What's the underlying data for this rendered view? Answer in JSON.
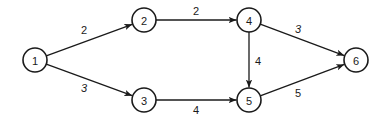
{
  "diagram": {
    "type": "directed-weighted-network",
    "nodes": [
      {
        "id": "1",
        "label": "1",
        "x": 35,
        "y": 60
      },
      {
        "id": "2",
        "label": "2",
        "x": 144,
        "y": 20
      },
      {
        "id": "3",
        "label": "3",
        "x": 144,
        "y": 100
      },
      {
        "id": "4",
        "label": "4",
        "x": 249,
        "y": 20
      },
      {
        "id": "5",
        "label": "5",
        "x": 249,
        "y": 100
      },
      {
        "id": "6",
        "label": "6",
        "x": 356,
        "y": 60
      }
    ],
    "edges": [
      {
        "from": "1",
        "to": "2",
        "weight": "2",
        "lx": 84,
        "ly": 30,
        "italic": false
      },
      {
        "from": "1",
        "to": "3",
        "weight": "3",
        "lx": 84,
        "ly": 88,
        "italic": true
      },
      {
        "from": "2",
        "to": "4",
        "weight": "2",
        "lx": 196,
        "ly": 11,
        "italic": false
      },
      {
        "from": "3",
        "to": "5",
        "weight": "4",
        "lx": 196,
        "ly": 110,
        "italic": false
      },
      {
        "from": "4",
        "to": "5",
        "weight": "4",
        "lx": 258,
        "ly": 61,
        "italic": false
      },
      {
        "from": "4",
        "to": "6",
        "weight": "3",
        "lx": 298,
        "ly": 29,
        "italic": true
      },
      {
        "from": "5",
        "to": "6",
        "weight": "5",
        "lx": 298,
        "ly": 93,
        "italic": false
      }
    ],
    "colors": {
      "stroke": "#1a1a1a",
      "background": "#ffffff"
    }
  }
}
